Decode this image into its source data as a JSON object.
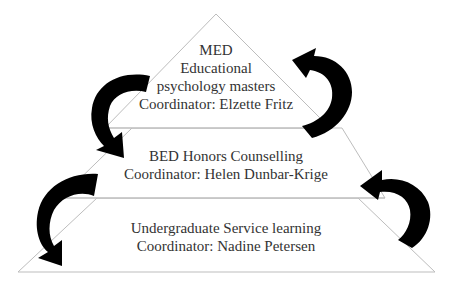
{
  "diagram": {
    "type": "pyramid",
    "description_visible": false,
    "colors": {
      "outline": "#b8b8b8",
      "fill": "#ffffff",
      "arrow": "#000000",
      "text": "#333333"
    },
    "tiers": [
      {
        "id": "top",
        "lines": [
          "MED",
          "Educational",
          "psychology masters",
          "Coordinator: Elzette Fritz"
        ]
      },
      {
        "id": "middle",
        "lines": [
          "BED Honors Counselling",
          "Coordinator: Helen Dunbar-Krige"
        ]
      },
      {
        "id": "bottom",
        "lines": [
          "Undergraduate Service learning",
          "Coordinator: Nadine Petersen"
        ]
      }
    ],
    "arrows": [
      {
        "id": "left-upper",
        "from": "top",
        "to": "middle",
        "side": "left",
        "direction": "down"
      },
      {
        "id": "left-lower",
        "from": "middle",
        "to": "bottom",
        "side": "left",
        "direction": "down"
      },
      {
        "id": "right-upper",
        "from": "middle",
        "to": "top",
        "side": "right",
        "direction": "up"
      },
      {
        "id": "right-lower",
        "from": "bottom",
        "to": "middle",
        "side": "right",
        "direction": "up"
      }
    ]
  }
}
